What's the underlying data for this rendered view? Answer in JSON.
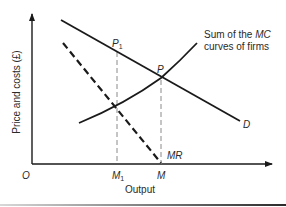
{
  "diagram": {
    "axes": {
      "y_label": "Price and costs (£)",
      "x_label": "Output",
      "origin_label": "O"
    },
    "curves": {
      "demand": {
        "label": "D",
        "style": "solid"
      },
      "marginal_revenue": {
        "label": "MR",
        "style": "dashed"
      },
      "marginal_cost": {
        "label_line1_prefix": "Sum of the ",
        "label_line1_italic": "MC",
        "label_line2": "curves of firms",
        "style": "solid"
      }
    },
    "points": {
      "p1": {
        "label": "P",
        "subscript": "1"
      },
      "p": {
        "label": "P"
      }
    },
    "x_ticks": {
      "m1": {
        "label": "M",
        "subscript": "1"
      },
      "m": {
        "label": "M"
      }
    },
    "colors": {
      "line": "#1a1a1a",
      "guide": "#8a8a8a",
      "text": "#2a2a2a"
    }
  }
}
